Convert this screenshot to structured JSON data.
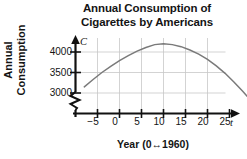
{
  "title": {
    "line1": "Annual Consumption of",
    "line2": "Cigarettes by Americans"
  },
  "axis_letters": {
    "vertical": "C",
    "horizontal": "t"
  },
  "ylabel": {
    "line1": "Annual",
    "line2": "Consumption"
  },
  "xlabel": "Year (0↔1960)",
  "chart_data": {
    "type": "line",
    "title": "Annual Consumption of Cigarettes by Americans",
    "xlabel": "Year (0↔1960)",
    "ylabel": "Annual Consumption",
    "x_axis_variable": "t",
    "y_axis_variable": "C",
    "grid": true,
    "legend": null,
    "axis_break_y": true,
    "xlim": [
      -8,
      29
    ],
    "ylim": [
      2870,
      4430
    ],
    "xticks": [
      -5,
      0,
      5,
      10,
      15,
      20,
      25
    ],
    "xtick_labels": [
      "−5",
      "0",
      "5",
      "10",
      "15",
      "20",
      "25"
    ],
    "yticks": [
      3000,
      3500,
      4000
    ],
    "ytick_labels": [
      "3000",
      "3500",
      "4000"
    ],
    "series": [
      {
        "name": "Cigarette consumption",
        "color": "#7a7a7a",
        "vertex": {
          "t": 8.5,
          "C": 4200
        },
        "x": [
          -8,
          -6,
          -4,
          -2,
          0,
          2,
          4,
          6,
          8,
          10,
          12,
          14,
          16,
          18,
          20,
          22,
          24,
          26,
          28,
          29
        ],
        "y": [
          3150,
          3330,
          3500,
          3650,
          3790,
          3910,
          4020,
          4110,
          4180,
          4200,
          4180,
          4130,
          4050,
          3950,
          3820,
          3660,
          3480,
          3270,
          3040,
          2920
        ]
      }
    ]
  },
  "colors": {
    "curve": "#7a7a7a",
    "grid": "#c8c8c8",
    "axis": "#111111",
    "text": "#141414",
    "background": "#ffffff"
  }
}
